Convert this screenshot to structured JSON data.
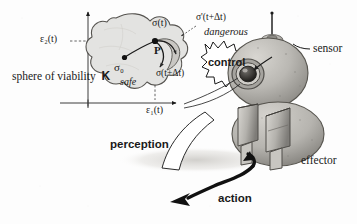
{
  "figure": {
    "background_color": "#fdfdfd",
    "ink_color": "#1a1a1a",
    "blob_fill": "#e3e3e1",
    "blob_stroke": "#4a4a4a",
    "robot_fill": "#b9b7b2",
    "robot_shadow": "#cfcdc9"
  },
  "axes": {
    "x_label": "ε₁(t)",
    "y_label": "ε₂(t)",
    "x_axis_name": "epsilon-1-axis",
    "y_axis_name": "epsilon-2-axis"
  },
  "state_space": {
    "viability_caption": "sphere of viability",
    "viability_symbol": "K",
    "safe_label": "safe",
    "dangerous_label": "dangerous",
    "point_label": "P",
    "sigma_initial": "σ₀",
    "sigma_t": "σ(t)",
    "sigma_t_dt": "σ(t+Δt)",
    "sigma_prime_t_dt": "σ'(t+Δt)"
  },
  "robot": {
    "control_label": "control",
    "sensor_label": "sensor",
    "effector_label": "effector",
    "perception_label": "perception",
    "action_label": "action"
  }
}
